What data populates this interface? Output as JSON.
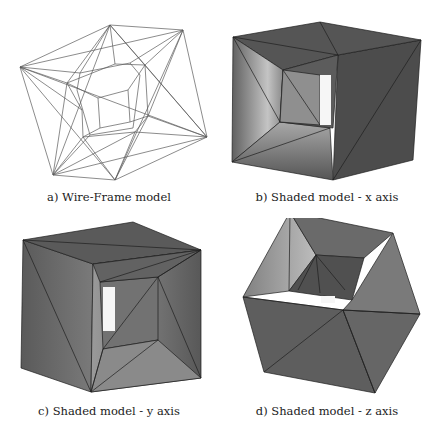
{
  "figure": {
    "panels": [
      {
        "id": "a",
        "caption": "a) Wire-Frame model",
        "type": "wireframe"
      },
      {
        "id": "b",
        "caption": "b) Shaded model - x axis",
        "type": "shaded",
        "axis": "x"
      },
      {
        "id": "c",
        "caption": "c) Shaded model - y axis",
        "type": "shaded",
        "axis": "y"
      },
      {
        "id": "d",
        "caption": "d) Shaded model - z axis",
        "type": "shaded",
        "axis": "z"
      }
    ]
  },
  "colors": {
    "background": "#ffffff",
    "wire": "#555555",
    "face_dark": "#4a4a4a",
    "face_mid": "#6a6a6a",
    "face_light": "#b8b8b8",
    "edge": "#1e1e1e",
    "hole": "#f4f4f4",
    "caption_text": "#222222"
  }
}
